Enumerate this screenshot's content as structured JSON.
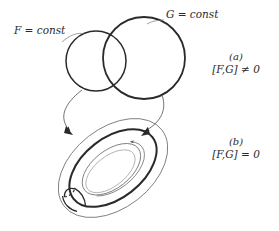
{
  "figure": {
    "background_color": "#ffffff",
    "stroke_dark": "#2a2a2a",
    "stroke_light": "#6e6e6e",
    "width": 279,
    "height": 231
  },
  "labels": {
    "f_const": "F = const",
    "g_const": "G = const"
  },
  "panels": [
    {
      "tag": "(a)",
      "expression": "[F,G] ≠ 0",
      "description": "two transversally intersecting thick circles"
    },
    {
      "tag": "(b)",
      "expression": "[F,G] = 0",
      "description": "tilted torus with meridian and longitude cycles"
    }
  ],
  "shapes": {
    "circle_f": {
      "cx": 96,
      "cy": 61,
      "r": 30,
      "stroke": "#2a2a2a",
      "width": 1.6
    },
    "circle_g": {
      "cx": 144,
      "cy": 58,
      "r": 41,
      "stroke": "#2a2a2a",
      "width": 1.8
    },
    "torus": {
      "cx": 113,
      "cy": 168,
      "tilt_deg": -38,
      "outer_rx": 62,
      "outer_ry": 40,
      "mid_rx": 50,
      "mid_ry": 30,
      "inner_rx": 34,
      "inner_ry": 19,
      "meridian_rx": 9,
      "meridian_ry": 13
    },
    "connector_left": {
      "from_x": 82,
      "from_y": 91,
      "to_x": 73,
      "to_y": 134
    },
    "connector_right": {
      "from_x": 160,
      "from_y": 96,
      "to_x": 143,
      "to_y": 133
    }
  },
  "icons": {
    "arrowhead": "arrow-head-icon",
    "dashed_meridian": "dashed-meridian-icon"
  }
}
